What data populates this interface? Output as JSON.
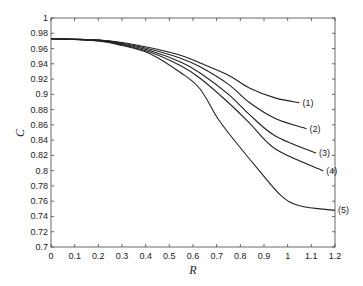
{
  "chart_data": {
    "type": "line",
    "title": "",
    "xlabel": "R",
    "ylabel": "C",
    "xlim": [
      0,
      1.2
    ],
    "ylim": [
      0.7,
      1.0
    ],
    "grid": false,
    "legend": "inline labels at curve ends",
    "x_ticks": [
      "0",
      "0.1",
      "0.2",
      "0.3",
      "0.4",
      "0.5",
      "0.6",
      "0.7",
      "0.8",
      "0.9",
      "1",
      "1.1",
      "1.2"
    ],
    "y_ticks": [
      "0.7",
      "0.72",
      "0.74",
      "0.76",
      "0.78",
      "0.8",
      "0.82",
      "0.84",
      "0.86",
      "0.88",
      "0.9",
      "0.92",
      "0.94",
      "0.96",
      "0.98",
      "1"
    ],
    "series": [
      {
        "name": "(1)",
        "x": [
          0,
          0.2,
          0.3,
          0.42,
          0.55,
          0.63,
          0.75,
          0.84,
          0.95,
          1.05
        ],
        "y": [
          0.973,
          0.971,
          0.968,
          0.961,
          0.951,
          0.941,
          0.925,
          0.908,
          0.895,
          0.889
        ]
      },
      {
        "name": "(2)",
        "x": [
          0,
          0.2,
          0.3,
          0.42,
          0.55,
          0.63,
          0.75,
          0.84,
          0.95,
          1.08
        ],
        "y": [
          0.973,
          0.971,
          0.967,
          0.959,
          0.947,
          0.936,
          0.913,
          0.889,
          0.868,
          0.855
        ]
      },
      {
        "name": "(3)",
        "x": [
          0,
          0.2,
          0.3,
          0.42,
          0.55,
          0.63,
          0.75,
          0.84,
          0.95,
          1.12
        ],
        "y": [
          0.973,
          0.971,
          0.966,
          0.957,
          0.942,
          0.928,
          0.9,
          0.873,
          0.845,
          0.823
        ]
      },
      {
        "name": "(4)",
        "x": [
          0,
          0.2,
          0.3,
          0.42,
          0.55,
          0.63,
          0.75,
          0.84,
          0.95,
          1.15
        ],
        "y": [
          0.973,
          0.97,
          0.965,
          0.955,
          0.937,
          0.921,
          0.889,
          0.862,
          0.828,
          0.8
        ]
      },
      {
        "name": "(5)",
        "x": [
          0,
          0.2,
          0.3,
          0.42,
          0.55,
          0.63,
          0.71,
          0.8,
          0.88,
          0.97,
          1.05,
          1.2
        ],
        "y": [
          0.973,
          0.97,
          0.964,
          0.953,
          0.928,
          0.907,
          0.866,
          0.83,
          0.8,
          0.768,
          0.754,
          0.748
        ]
      }
    ],
    "line_color": "#222222"
  }
}
